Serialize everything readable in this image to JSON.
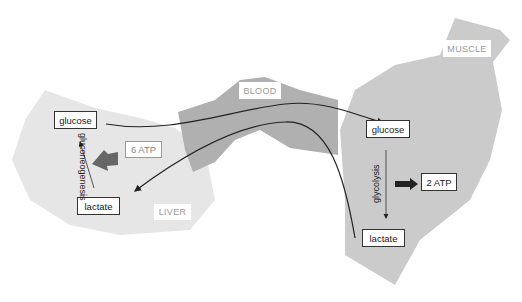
{
  "regions": {
    "liver": {
      "label": "LIVER",
      "color": "#e6e6e6"
    },
    "blood": {
      "label": "BLOOD",
      "color": "#b0b0b0"
    },
    "muscle": {
      "label": "MUSCLE",
      "color": "#cbcbcb"
    }
  },
  "liver": {
    "glucose": "glucose",
    "lactate": "lactate",
    "process": "gluconeogenesis",
    "atp": "6 ATP"
  },
  "muscle": {
    "glucose": "glucose",
    "lactate": "lactate",
    "process": "glycolysis",
    "atp": "2 ATP"
  },
  "colors": {
    "arrow": "#222222",
    "atp_arrow_liver": "#666666",
    "atp_arrow_muscle": "#222222"
  }
}
